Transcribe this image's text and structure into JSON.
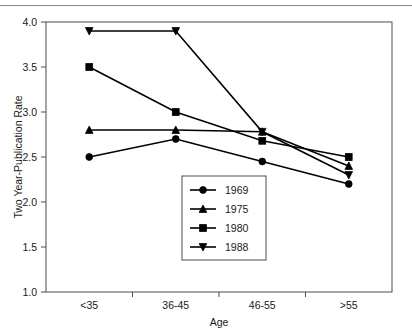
{
  "chart_data": {
    "type": "line",
    "title": "",
    "xlabel": "Age",
    "ylabel": "Two Year-Publication Rate",
    "categories": [
      "<35",
      "36-45",
      "46-55",
      ">55"
    ],
    "ylim": [
      1.0,
      4.0
    ],
    "yticks": [
      "1.0",
      "1.5",
      "2.0",
      "2.5",
      "3.0",
      "3.5",
      "4.0"
    ],
    "ytick_values": [
      1.0,
      1.5,
      2.0,
      2.5,
      3.0,
      3.5,
      4.0
    ],
    "grid": false,
    "legend_position": "lower center",
    "series": [
      {
        "name": "1969",
        "marker": "circle",
        "values": [
          2.5,
          2.7,
          2.45,
          2.2
        ]
      },
      {
        "name": "1975",
        "marker": "triangle-up",
        "values": [
          2.8,
          2.8,
          2.78,
          2.4
        ]
      },
      {
        "name": "1980",
        "marker": "square",
        "values": [
          3.5,
          3.0,
          2.68,
          2.5
        ]
      },
      {
        "name": "1988",
        "marker": "triangle-down",
        "values": [
          3.9,
          3.9,
          2.78,
          2.3
        ]
      }
    ]
  },
  "legend": {
    "entries": [
      "1969",
      "1975",
      "1980",
      "1988"
    ]
  },
  "colors": {
    "line": "#000000",
    "axis": "#4d4d4d",
    "text": "#1a1a1a",
    "background": "#ffffff"
  }
}
